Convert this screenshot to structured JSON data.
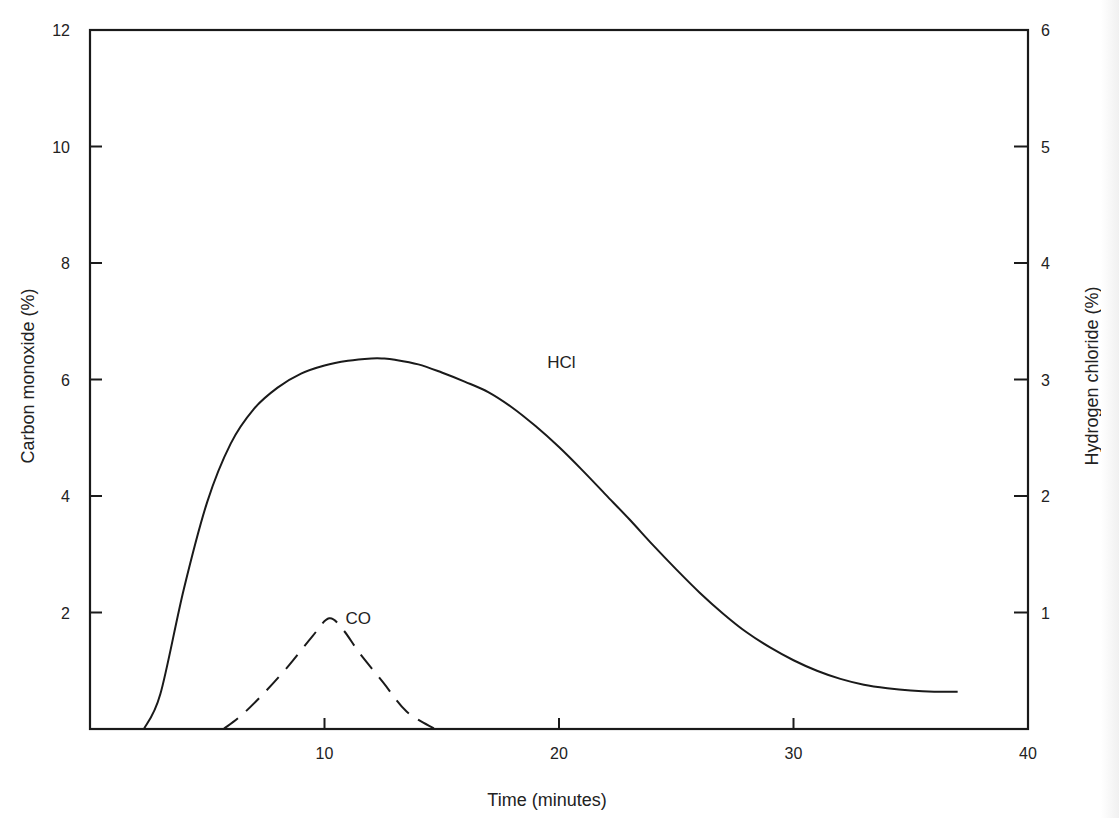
{
  "chart_data": {
    "type": "line",
    "title": "",
    "xlabel": "Time (minutes)",
    "ylabel": "Carbon monoxide (%)",
    "y2label": "Hydrogen chloride (%)",
    "xlim": [
      0,
      40
    ],
    "ylim": [
      0,
      12
    ],
    "y2lim": [
      0,
      6
    ],
    "x_ticks": [
      10,
      20,
      30,
      40
    ],
    "y_ticks": [
      2,
      4,
      6,
      8,
      10,
      12
    ],
    "y2_ticks": [
      1,
      2,
      3,
      4,
      5,
      6
    ],
    "grid": false,
    "legend": "none (curves labelled inline)",
    "series": [
      {
        "name": "HCl",
        "axis": "right",
        "style": "solid",
        "label_pos": [
          19.5,
          3.1
        ],
        "x": [
          2.3,
          3,
          4,
          5,
          6,
          7,
          8,
          9,
          10,
          11,
          12,
          12.5,
          13,
          14,
          15,
          16,
          17,
          18,
          19,
          20,
          21,
          22,
          23,
          24,
          25,
          26,
          27,
          28,
          29,
          30,
          31,
          32,
          33,
          34,
          35,
          36,
          37
        ],
        "values": [
          0,
          0.3,
          1.2,
          1.95,
          2.45,
          2.75,
          2.93,
          3.05,
          3.12,
          3.16,
          3.18,
          3.18,
          3.17,
          3.13,
          3.06,
          2.98,
          2.89,
          2.76,
          2.6,
          2.42,
          2.22,
          2.01,
          1.8,
          1.58,
          1.37,
          1.17,
          0.99,
          0.83,
          0.7,
          0.59,
          0.5,
          0.43,
          0.38,
          0.35,
          0.33,
          0.32,
          0.32
        ]
      },
      {
        "name": "CO",
        "axis": "left",
        "style": "dashed",
        "label_pos": [
          10.9,
          1.8
        ],
        "x": [
          5.7,
          6.5,
          7.5,
          8.5,
          9.5,
          10.2,
          10.8,
          11.5,
          12.5,
          13.5,
          14.7
        ],
        "values": [
          0,
          0.25,
          0.65,
          1.1,
          1.6,
          1.9,
          1.7,
          1.3,
          0.8,
          0.3,
          0
        ]
      }
    ]
  },
  "labels": {
    "hcl": "HCl",
    "co": "CO",
    "xlabel": "Time (minutes)",
    "ylabel": "Carbon monoxide (%)",
    "y2label": "Hydrogen chloride (%)"
  }
}
